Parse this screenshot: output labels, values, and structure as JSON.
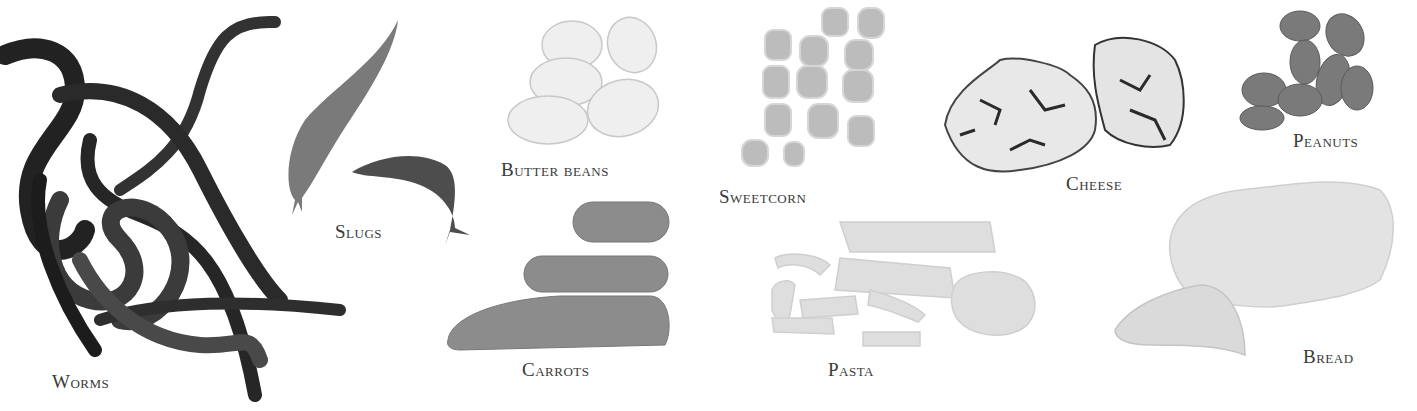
{
  "items": [
    {
      "id": "worms",
      "label": "Worms",
      "color": "#2b2b2b"
    },
    {
      "id": "slugs",
      "label": "Slugs",
      "color": "#6e6e6e"
    },
    {
      "id": "butter-beans",
      "label": "Butter beans",
      "color": "#ededed"
    },
    {
      "id": "sweetcorn",
      "label": "Sweetcorn",
      "color": "#bdbdbd"
    },
    {
      "id": "cheese",
      "label": "Cheese",
      "color": "#e6e6e6"
    },
    {
      "id": "peanuts",
      "label": "Peanuts",
      "color": "#777777"
    },
    {
      "id": "carrots",
      "label": "Carrots",
      "color": "#8a8a8a"
    },
    {
      "id": "pasta",
      "label": "Pasta",
      "color": "#dcdcdc"
    },
    {
      "id": "bread",
      "label": "Bread",
      "color": "#e2e2e2"
    }
  ]
}
